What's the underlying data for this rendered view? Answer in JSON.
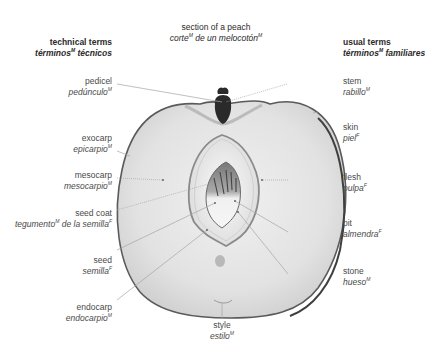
{
  "title": {
    "en": "section of a peach",
    "es_parts": [
      "corte",
      "M",
      " de un melocotón",
      "M"
    ]
  },
  "headers": {
    "left": {
      "en": "technical terms",
      "es": "términos",
      "es_sup": "M",
      "es_rest": " técnicos"
    },
    "right": {
      "en": "usual terms",
      "es": "términos",
      "es_sup": "M",
      "es_rest": " familiares"
    }
  },
  "labels": {
    "left": [
      {
        "id": "pedicel",
        "en": "pedicel",
        "es": "pedúnculo",
        "gender": "M"
      },
      {
        "id": "exocarp",
        "en": "exocarp",
        "es": "epicarpio",
        "gender": "M"
      },
      {
        "id": "mesocarp",
        "en": "mesocarp",
        "es": "mesocarpio",
        "gender": "M"
      },
      {
        "id": "seed-coat",
        "en": "seed coat",
        "es": "tegumento",
        "gender": "M",
        "es_rest": " de la semilla",
        "gender2": "F"
      },
      {
        "id": "seed",
        "en": "seed",
        "es": "semilla",
        "gender": "F"
      },
      {
        "id": "endocarp",
        "en": "endocarp",
        "es": "endocarpio",
        "gender": "M"
      }
    ],
    "right": [
      {
        "id": "stem",
        "en": "stem",
        "es": "rabillo",
        "gender": "M"
      },
      {
        "id": "skin",
        "en": "skin",
        "es": "piel",
        "gender": "F"
      },
      {
        "id": "flesh",
        "en": "flesh",
        "es": "pulpa",
        "gender": "F"
      },
      {
        "id": "pit",
        "en": "pit",
        "es": "almendra",
        "gender": "F"
      },
      {
        "id": "stone",
        "en": "stone",
        "es": "hueso",
        "gender": "M"
      }
    ],
    "bottom": [
      {
        "id": "style",
        "en": "style",
        "es": "estilo",
        "gender": "M"
      }
    ]
  },
  "colors": {
    "fruit_fill": "#e6e6e6",
    "fruit_edge": "#555555",
    "stone_fill": "#f4f4f4",
    "seed_dark": "#6a6a6a",
    "stem": "#2a2a2a",
    "leader_line": "#9a9a9a",
    "text": "#4a4a4a"
  }
}
